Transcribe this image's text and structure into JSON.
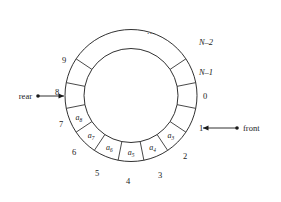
{
  "figure": {
    "dots_label": "...",
    "geometry": {
      "center_x": 131,
      "center_y": 95.5,
      "outer_radius": 66,
      "inner_radius": 47,
      "slot_count": 16,
      "note": "Slot 0 at right (3 o'clock), increasing clockwise"
    },
    "colors": {
      "stroke": "#1a1a1a",
      "background": "#ffffff"
    },
    "pointers": [
      {
        "name": "rear",
        "label": "rear",
        "side": "left",
        "text_x": 12,
        "text_y": 99,
        "dot_x": 34,
        "dot_y": 96,
        "line_x1": 36,
        "line_y1": 96,
        "line_x2": 64,
        "line_y2": 96,
        "arrow_dir": "right"
      },
      {
        "name": "front",
        "label": "front",
        "side": "right",
        "text_x": 243,
        "text_y": 131,
        "dot_x": 238,
        "dot_y": 128,
        "line_x1": 236,
        "line_y1": 128,
        "line_x2": 202,
        "line_y2": 128,
        "arrow_dir": "left"
      }
    ],
    "slots": [
      {
        "index": 0,
        "outer_label": "0",
        "italic_label": false,
        "value": "",
        "subscript": "",
        "label_x": 205,
        "label_y": 99
      },
      {
        "index": 1,
        "outer_label": "1",
        "italic_label": false,
        "value": "",
        "subscript": "",
        "label_x": 201,
        "label_y": 131
      },
      {
        "index": 2,
        "outer_label": "2",
        "italic_label": false,
        "value": "a",
        "subscript": "3",
        "label_x": 185,
        "label_y": 159
      },
      {
        "index": 3,
        "outer_label": "3",
        "italic_label": false,
        "value": "a",
        "subscript": "4",
        "label_x": 160,
        "label_y": 178
      },
      {
        "index": 4,
        "outer_label": "4",
        "italic_label": false,
        "value": "a",
        "subscript": "5",
        "label_x": 128,
        "label_y": 184
      },
      {
        "index": 5,
        "outer_label": "5",
        "italic_label": false,
        "value": "a",
        "subscript": "6",
        "label_x": 97,
        "label_y": 176
      },
      {
        "index": 6,
        "outer_label": "6",
        "italic_label": false,
        "value": "a",
        "subscript": "7",
        "label_x": 74,
        "label_y": 155
      },
      {
        "index": 7,
        "outer_label": "7",
        "italic_label": false,
        "value": "a",
        "subscript": "8",
        "label_x": 61,
        "label_y": 127
      },
      {
        "index": 8,
        "outer_label": "8",
        "italic_label": false,
        "value": "",
        "subscript": "",
        "label_x": 57,
        "label_y": 95
      },
      {
        "index": 9,
        "outer_label": "9",
        "italic_label": false,
        "value": "",
        "subscript": "",
        "label_x": 64,
        "label_y": 63
      },
      {
        "index": 10,
        "outer_label": "",
        "italic_label": false,
        "value": "",
        "subscript": "",
        "label_x": 0,
        "label_y": 0
      },
      {
        "index": 11,
        "outer_label": "",
        "italic_label": false,
        "value": "",
        "subscript": "",
        "label_x": 0,
        "label_y": 0
      },
      {
        "index": 12,
        "outer_label": "",
        "italic_label": false,
        "value": "",
        "subscript": "",
        "label_x": 0,
        "label_y": 0
      },
      {
        "index": 13,
        "outer_label": "",
        "italic_label": false,
        "value": "",
        "subscript": "",
        "label_x": 0,
        "label_y": 0
      },
      {
        "index": 14,
        "outer_label": "N–2",
        "italic_label": true,
        "value": "",
        "subscript": "",
        "label_x": 206,
        "label_y": 45
      },
      {
        "index": 15,
        "outer_label": "N–1",
        "italic_label": true,
        "value": "",
        "subscript": "",
        "label_x": 206,
        "label_y": 75
      }
    ],
    "dots_position": {
      "x": 151,
      "y": 34
    }
  }
}
